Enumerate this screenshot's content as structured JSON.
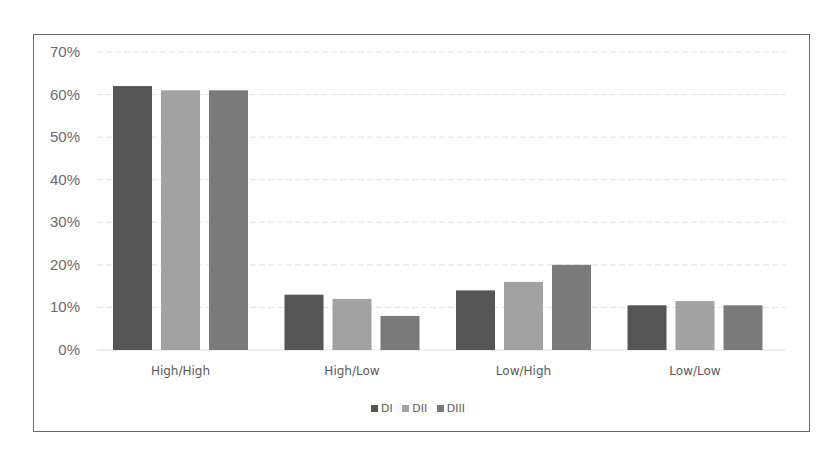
{
  "chart_data": {
    "type": "bar",
    "title": "",
    "xlabel": "",
    "ylabel": "",
    "categories": [
      "High/High",
      "High/Low",
      "Low/High",
      "Low/Low"
    ],
    "series": [
      {
        "name": "DI",
        "color": "#555555",
        "values": [
          62,
          13,
          14,
          10.5
        ]
      },
      {
        "name": "DII",
        "color": "#a2a2a2",
        "values": [
          61,
          12,
          16,
          11.5
        ]
      },
      {
        "name": "DIII",
        "color": "#7a7a7a",
        "values": [
          61,
          8,
          20,
          10.5
        ]
      }
    ],
    "ylim": [
      0,
      70
    ],
    "yticks": [
      "0%",
      "10%",
      "20%",
      "30%",
      "40%",
      "50%",
      "60%",
      "70%"
    ],
    "grid": true,
    "legend_position": "bottom"
  },
  "legend": {
    "items": [
      {
        "label": "DI",
        "color": "#555555"
      },
      {
        "label": "DII",
        "color": "#a2a2a2"
      },
      {
        "label": "DIII",
        "color": "#7a7a7a"
      }
    ]
  }
}
